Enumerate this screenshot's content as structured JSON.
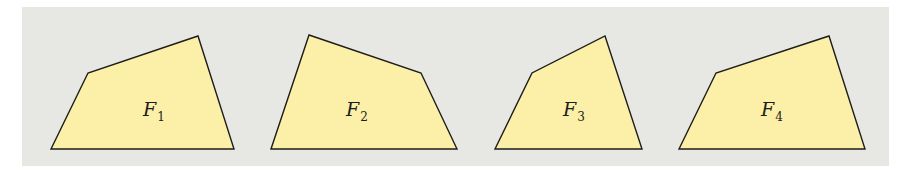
{
  "colors": {
    "background": "#e7e8e3",
    "fill": "#fcefa8",
    "stroke": "#1d1d1b"
  },
  "figures": [
    {
      "name": "F",
      "subscript": "1",
      "points": "51,149 88,73 198,36 234,149",
      "label_x": 143,
      "label_y": 116
    },
    {
      "name": "F",
      "subscript": "2",
      "points": "271,149 309,35 421,73 457,149",
      "label_x": 346,
      "label_y": 116
    },
    {
      "name": "F",
      "subscript": "3",
      "points": "495,149 532,73 605,36 642,149",
      "label_x": 563,
      "label_y": 116
    },
    {
      "name": "F",
      "subscript": "4",
      "points": "679,149 716,73 829,36 865,149",
      "label_x": 761,
      "label_y": 116
    }
  ]
}
